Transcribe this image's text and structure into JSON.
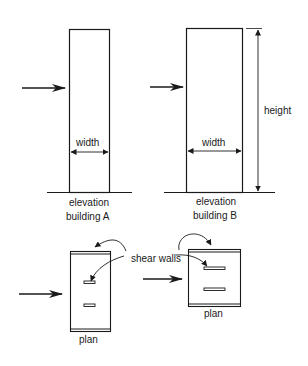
{
  "diagram": {
    "title": "",
    "building_a": {
      "width_label": "width",
      "view_label": "elevation",
      "name_label": "building A"
    },
    "building_b": {
      "width_label": "width",
      "height_label": "height",
      "view_label": "elevation",
      "name_label": "building B"
    },
    "plan_a": {
      "label": "plan"
    },
    "plan_b": {
      "label": "plan"
    },
    "callout": {
      "label": "shear walls"
    },
    "colors": {
      "line": "#1a1a1a",
      "background": "#ffffff"
    }
  }
}
